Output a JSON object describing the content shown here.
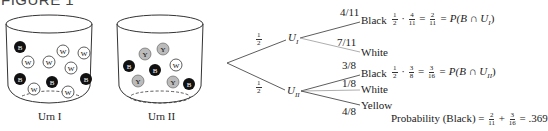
{
  "figure": {
    "title": "FIGURE 1"
  },
  "urns": [
    {
      "label": "Urn I",
      "balls": [
        "B",
        "W",
        "W",
        "W",
        "W",
        "W",
        "B",
        "B",
        "B",
        "W",
        "W"
      ],
      "black": 4,
      "white": 7,
      "yellow": 0
    },
    {
      "label": "Urn II",
      "balls": [
        "Y",
        "Y",
        "B",
        "B",
        "W",
        "Y",
        "Y",
        "B"
      ],
      "black": 3,
      "white": 1,
      "yellow": 4
    }
  ],
  "tree": {
    "root_branches": [
      {
        "prob": "1",
        "prob_den": "2",
        "node": "U",
        "node_sub": "I"
      },
      {
        "prob": "1",
        "prob_den": "2",
        "node": "U",
        "node_sub": "II"
      }
    ],
    "u1_branches": [
      {
        "prob": "4/11",
        "outcome": "Black"
      },
      {
        "prob": "7/11",
        "outcome": "White"
      }
    ],
    "u2_branches": [
      {
        "prob": "3/8",
        "outcome": "Black"
      },
      {
        "prob": "1/8",
        "outcome": "White"
      },
      {
        "prob": "4/8",
        "outcome": "Yellow"
      }
    ],
    "calc1": {
      "a_num": "1",
      "a_den": "2",
      "dot": "·",
      "b_num": "4",
      "b_den": "11",
      "eq": "=",
      "c_num": "2",
      "c_den": "11",
      "rhs": "= P(B ∩ U",
      "rhs_sub": "I",
      "rhs_end": ")"
    },
    "calc2": {
      "a_num": "1",
      "a_den": "2",
      "dot": "·",
      "b_num": "3",
      "b_den": "8",
      "eq": "=",
      "c_num": "3",
      "c_den": "16",
      "rhs": "= P(B ∩ U",
      "rhs_sub": "II",
      "rhs_end": ")"
    },
    "total": {
      "label": "Probability (Black) =",
      "a_num": "2",
      "a_den": "11",
      "plus": "+",
      "b_num": "3",
      "b_den": "16",
      "result": "= .369"
    }
  }
}
